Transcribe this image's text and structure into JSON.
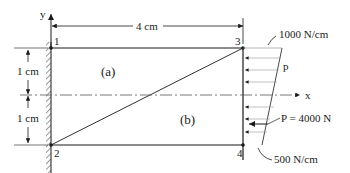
{
  "diagram": {
    "axes": {
      "x_label": "x",
      "y_label": "y"
    },
    "nodes": [
      {
        "id": "1",
        "label": "1"
      },
      {
        "id": "2",
        "label": "2"
      },
      {
        "id": "3",
        "label": "3"
      },
      {
        "id": "4",
        "label": "4"
      }
    ],
    "elements": [
      {
        "id": "a",
        "label": "(a)"
      },
      {
        "id": "b",
        "label": "(b)"
      }
    ],
    "dimensions": {
      "width": "4 cm",
      "upper_height": "1 cm",
      "lower_height": "1 cm"
    },
    "loads": {
      "top_intensity": "1000 N/cm",
      "distributed_label": "p",
      "resultant": "P = 4000 N",
      "bottom_intensity": "500 N/cm"
    },
    "colors": {
      "line": "#1a1a1a",
      "dashed": "#555555"
    }
  }
}
